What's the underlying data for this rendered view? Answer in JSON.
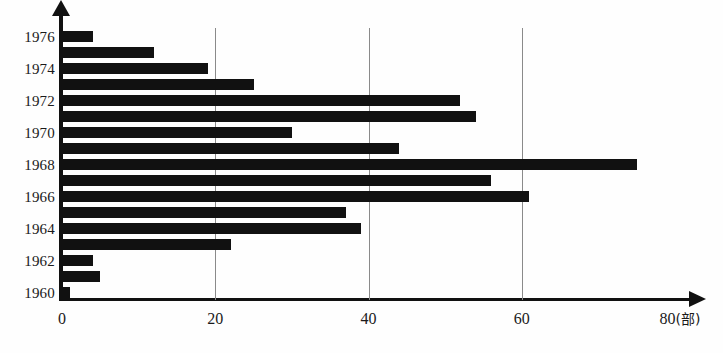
{
  "chart_data": {
    "type": "bar",
    "orientation": "horizontal",
    "title": "",
    "subtitle": "",
    "xlabel": "",
    "ylabel": "",
    "unit_label": "(部)",
    "xlim": [
      0,
      80
    ],
    "ylim_categories": [
      "1960",
      "1976"
    ],
    "grid": "vertical",
    "legend": "none",
    "xticks": [
      0,
      20,
      40,
      60,
      80
    ],
    "xtick_labels": [
      "0",
      "20",
      "40",
      "60",
      "80"
    ],
    "ytick_labels": [
      "1960",
      "1962",
      "1964",
      "1966",
      "1968",
      "1970",
      "1972",
      "1974",
      "1976"
    ],
    "bar_color": "#111111",
    "grid_color": "#8a8a8a",
    "axis_color": "#111111",
    "categories": [
      "1976",
      "1975",
      "1974",
      "1973",
      "1972",
      "1971",
      "1970",
      "1969",
      "1968",
      "1967",
      "1966",
      "1965",
      "1964",
      "1963",
      "1962",
      "1961",
      "1960"
    ],
    "values": [
      4,
      12,
      19,
      25,
      52,
      54,
      30,
      44,
      75,
      56,
      61,
      37,
      39,
      22,
      4,
      5,
      1
    ],
    "series": [
      {
        "name": "",
        "values": [
          4,
          12,
          19,
          25,
          52,
          54,
          30,
          44,
          75,
          56,
          61,
          37,
          39,
          22,
          4,
          5,
          1
        ]
      }
    ],
    "points": [
      {
        "category": "1976",
        "value": 4
      },
      {
        "category": "1975",
        "value": 12
      },
      {
        "category": "1974",
        "value": 19
      },
      {
        "category": "1973",
        "value": 25
      },
      {
        "category": "1972",
        "value": 52
      },
      {
        "category": "1971",
        "value": 54
      },
      {
        "category": "1970",
        "value": 30
      },
      {
        "category": "1969",
        "value": 44
      },
      {
        "category": "1968",
        "value": 75
      },
      {
        "category": "1967",
        "value": 56
      },
      {
        "category": "1966",
        "value": 61
      },
      {
        "category": "1965",
        "value": 37
      },
      {
        "category": "1964",
        "value": 39
      },
      {
        "category": "1963",
        "value": 22
      },
      {
        "category": "1962",
        "value": 4
      },
      {
        "category": "1961",
        "value": 5
      },
      {
        "category": "1960",
        "value": 1
      }
    ]
  },
  "axis": {
    "x_tick_labels": [
      {
        "text": "0",
        "value": 0
      },
      {
        "text": "20",
        "value": 20
      },
      {
        "text": "40",
        "value": 40
      },
      {
        "text": "60",
        "value": 60
      },
      {
        "text": "80",
        "value": 80
      }
    ],
    "x_unit": "(部)",
    "y_tick_labels": [
      "1976",
      "1974",
      "1972",
      "1970",
      "1968",
      "1966",
      "1964",
      "1962",
      "1960"
    ]
  }
}
